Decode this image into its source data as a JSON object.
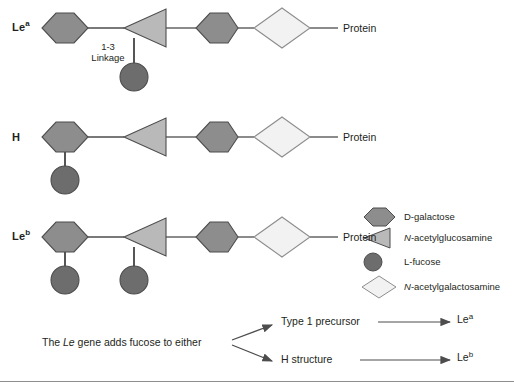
{
  "figure": {
    "title_rows": [
      {
        "id": "lea",
        "label_html": "Le<sup>a</sup>",
        "label_text": "Le a"
      },
      {
        "id": "h",
        "label_html": "H",
        "label_text": "H"
      },
      {
        "id": "leb",
        "label_html": "Le<sup>b</sup>",
        "label_text": "Le b"
      }
    ],
    "protein_label": "Protein",
    "linkage_line1": "1-3",
    "linkage_line2": "Linkage"
  },
  "legend": {
    "items": [
      {
        "shape": "hexagon",
        "label_html": "D-galactose",
        "label_text": "D-galactose",
        "color": "#8d8d8d"
      },
      {
        "shape": "triangle",
        "label_html": "<i>N</i>-acetylglucosamine",
        "label_text": "N-acetylglucosamine",
        "color": "#b9b9b9"
      },
      {
        "shape": "circle",
        "label_html": "L-fucose",
        "label_text": "L-fucose",
        "color": "#6d6d6d"
      },
      {
        "shape": "diamond",
        "label_html": "<i>N</i>-acetylgalactosamine",
        "label_text": "N-acetylgalactosamine",
        "color": "#f2f2f2"
      }
    ]
  },
  "flow": {
    "source_html": "The <i>Le</i> gene adds fucose to either",
    "source_text": "The Le gene adds fucose to either",
    "branches": [
      {
        "from_html": "Type 1 precursor",
        "from_text": "Type 1 precursor",
        "to_html": "Le<sup>a</sup>",
        "to_text": "Le a"
      },
      {
        "from_html": "H structure",
        "from_text": "H structure",
        "to_html": "Le<sup>b</sup>",
        "to_text": "Le b"
      }
    ]
  },
  "colors": {
    "galactose": "#8d8d8d",
    "glcnac": "#b9b9b9",
    "fucose": "#6d6d6d",
    "galnac": "#f2f2f2",
    "stroke": "#4d4d4d",
    "text": "#231f20",
    "rule": "#8d8d8d"
  },
  "chart_data": {
    "type": "diagram",
    "rows": [
      {
        "name": "Le a",
        "backbone": [
          "D-galactose",
          "N-acetylglucosamine",
          "D-galactose",
          "N-acetylgalactosamine",
          "Protein"
        ],
        "branches": [
          {
            "attached_to": "N-acetylglucosamine",
            "residue": "L-fucose",
            "linkage": "1-3 Linkage"
          }
        ]
      },
      {
        "name": "H",
        "backbone": [
          "D-galactose",
          "N-acetylglucosamine",
          "D-galactose",
          "N-acetylgalactosamine",
          "Protein"
        ],
        "branches": [
          {
            "attached_to": "D-galactose",
            "residue": "L-fucose",
            "linkage": ""
          }
        ]
      },
      {
        "name": "Le b",
        "backbone": [
          "D-galactose",
          "N-acetylglucosamine",
          "D-galactose",
          "N-acetylgalactosamine",
          "Protein"
        ],
        "branches": [
          {
            "attached_to": "D-galactose",
            "residue": "L-fucose",
            "linkage": ""
          },
          {
            "attached_to": "N-acetylglucosamine",
            "residue": "L-fucose",
            "linkage": ""
          }
        ]
      }
    ]
  }
}
